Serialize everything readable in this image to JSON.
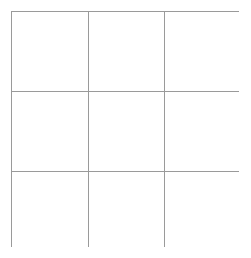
{
  "figure": {
    "type": "empty-grid",
    "title": "",
    "rows": 3,
    "columns": 3,
    "line_color": "#9a9a9a",
    "cell_fill": "#ffffff",
    "background": "#ffffff",
    "line_width_px": 1
  },
  "grid": {
    "cells": [
      {
        "row": 1,
        "column": 1,
        "text": ""
      },
      {
        "row": 1,
        "column": 2,
        "text": ""
      },
      {
        "row": 1,
        "column": 3,
        "text": ""
      },
      {
        "row": 2,
        "column": 1,
        "text": ""
      },
      {
        "row": 2,
        "column": 2,
        "text": ""
      },
      {
        "row": 2,
        "column": 3,
        "text": ""
      },
      {
        "row": 3,
        "column": 1,
        "text": ""
      },
      {
        "row": 3,
        "column": 2,
        "text": ""
      },
      {
        "row": 3,
        "column": 3,
        "text": ""
      }
    ]
  }
}
